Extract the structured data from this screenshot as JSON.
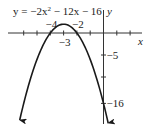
{
  "chart_data": {
    "type": "line",
    "title_parts": {
      "lhs": "y = −2x",
      "exp": "2",
      "rhs": " − 12x − 16"
    },
    "function": {
      "a": -2,
      "b": -12,
      "c": -16
    },
    "xlabel": "x",
    "ylabel": "y",
    "x_range": [
      -6.3,
      0.35
    ],
    "xlim": [
      -7.8,
      3.3
    ],
    "ylim": [
      -21,
      7.5
    ],
    "grid": false,
    "x_ticks": [
      -6,
      -5,
      -4,
      -3,
      -2,
      -1,
      1,
      2
    ],
    "y_ticks": [
      -5,
      -10,
      -16
    ],
    "x_tick_labels": [
      {
        "value": -4,
        "text": "−4",
        "position": "above"
      },
      {
        "value": -3,
        "text": "−3",
        "position": "below"
      },
      {
        "value": -2,
        "text": "−2",
        "position": "above"
      }
    ],
    "y_tick_labels": [
      {
        "value": -5,
        "text": "−5"
      },
      {
        "value": -16,
        "text": "−16"
      }
    ],
    "key_points": {
      "vertex": [
        -3,
        2
      ],
      "x_intercepts": [
        -4,
        -2
      ],
      "y_intercept": [
        0,
        -16
      ]
    },
    "arrows_on_ends": true,
    "colors": {
      "curve": "#1a1a1a",
      "axes": "#333333",
      "text": "#222222"
    }
  }
}
